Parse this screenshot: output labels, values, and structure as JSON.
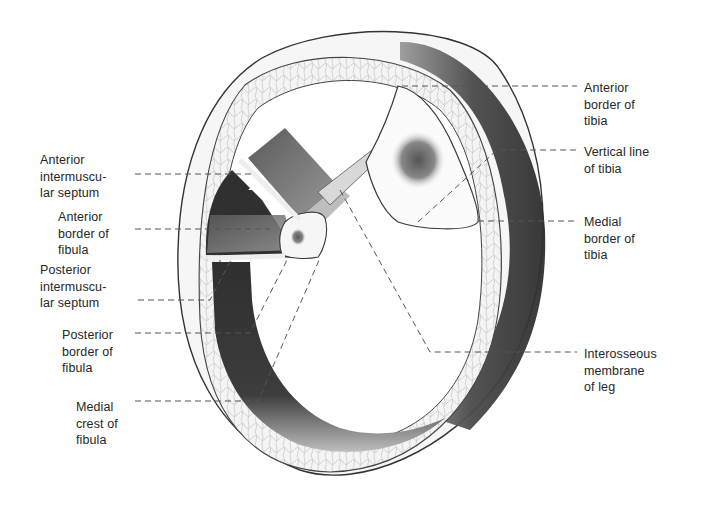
{
  "figure": {
    "colors": {
      "background": "#ffffff",
      "ink": "#2a2a2a",
      "muscle_dark": "#3a3a3a",
      "muscle_mid": "#777777",
      "fat_layer": "#f2f2f2",
      "leader_line": "#555555"
    }
  },
  "labels": {
    "left": [
      {
        "id": "anterior-intermuscular-septum",
        "text": "Anterior\nintermuscu-\nlar septum"
      },
      {
        "id": "anterior-border-of-fibula",
        "text": "Anterior\nborder of\nfibula"
      },
      {
        "id": "posterior-intermuscular-septum",
        "text": "Posterior\nintermuscu-\nlar septum"
      },
      {
        "id": "posterior-border-of-fibula",
        "text": "Posterior\nborder of\nfibula"
      },
      {
        "id": "medial-crest-of-fibula",
        "text": "Medial\ncrest of\nfibula"
      }
    ],
    "right": [
      {
        "id": "anterior-border-of-tibia",
        "text": "Anterior\nborder of\ntibia"
      },
      {
        "id": "vertical-line-of-tibia",
        "text": "Vertical line\nof tibia"
      },
      {
        "id": "medial-border-of-tibia",
        "text": "Medial\nborder of\ntibia"
      },
      {
        "id": "interosseous-membrane-of-leg",
        "text": "Interosseous\nmembrane\nof leg"
      }
    ]
  }
}
